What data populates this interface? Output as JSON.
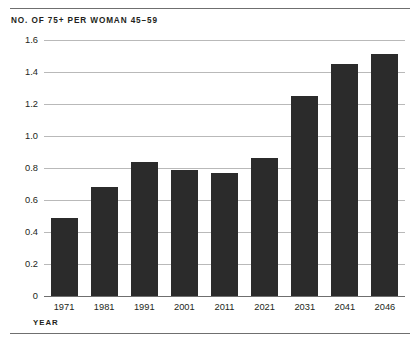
{
  "chart_data": {
    "type": "bar",
    "title": "NO. OF 75+ PER WOMAN 45–59",
    "xlabel": "YEAR",
    "ylabel": "",
    "categories": [
      "1971",
      "1981",
      "1991",
      "2001",
      "2011",
      "2021",
      "2031",
      "2041",
      "2046"
    ],
    "values": [
      0.49,
      0.68,
      0.84,
      0.79,
      0.77,
      0.86,
      1.25,
      1.45,
      1.51
    ],
    "ylim": [
      0,
      1.6
    ],
    "ytick_labels": [
      "0",
      "0.2",
      "0.4",
      "0.6",
      "0.8",
      "1.0",
      "1.2",
      "1.4",
      "1.6"
    ],
    "ytick_values": [
      0,
      0.2,
      0.4,
      0.6,
      0.8,
      1.0,
      1.2,
      1.4,
      1.6
    ],
    "grid": true,
    "legend": false,
    "bar_color": "#2b2b2b",
    "gridline_color": "#b9b9b9",
    "axis_color": "#6f6f6f"
  }
}
